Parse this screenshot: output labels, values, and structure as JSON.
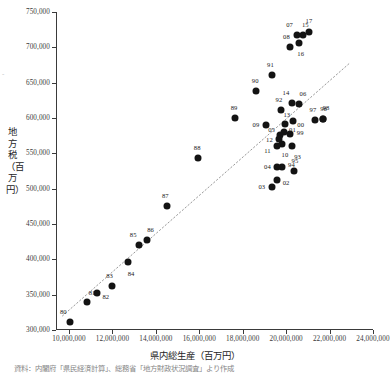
{
  "chart_data": {
    "type": "scatter",
    "title": "",
    "xlabel": "県内総生産（百万円）",
    "ylabel": "地方税（百万円）",
    "xlim": [
      9400000,
      24000000
    ],
    "ylim": [
      300000,
      750000
    ],
    "xticks": [
      10000000,
      12000000,
      14000000,
      16000000,
      18000000,
      20000000,
      22000000,
      24000000
    ],
    "xtick_labels": [
      "10,000,000",
      "12,000,000",
      "14,000,000",
      "16,000,000",
      "18,000,000",
      "20,000,000",
      "22,000,000",
      "24,000,000"
    ],
    "yticks": [
      300000,
      350000,
      400000,
      450000,
      500000,
      550000,
      600000,
      650000,
      700000,
      750000
    ],
    "ytick_labels": [
      "300,000",
      "350,000",
      "400,000",
      "450,000",
      "500,000",
      "550,000",
      "600,000",
      "650,000",
      "700,000",
      "750,000"
    ],
    "grid": false,
    "legend": "none",
    "marker_color": "#131313",
    "trendline": {
      "style": "dotted",
      "color": "#9a9a9a",
      "x1": 9700000,
      "y1": 320000,
      "x2": 22900000,
      "y2": 677000
    },
    "points": [
      {
        "label": "80",
        "x": 10060000,
        "y": 312000,
        "lx": -7,
        "ly": -11
      },
      {
        "label": "81",
        "x": 10830000,
        "y": 340000,
        "lx": 5,
        "ly": -10
      },
      {
        "label": "82",
        "x": 11280000,
        "y": 352000,
        "lx": 9,
        "ly": 3
      },
      {
        "label": "83",
        "x": 11960000,
        "y": 362000,
        "lx": -2,
        "ly": -11
      },
      {
        "label": "84",
        "x": 12720000,
        "y": 396000,
        "lx": 3,
        "ly": 11
      },
      {
        "label": "85",
        "x": 13230000,
        "y": 420000,
        "lx": -6,
        "ly": -11
      },
      {
        "label": "86",
        "x": 13570000,
        "y": 427000,
        "lx": 4,
        "ly": -11
      },
      {
        "label": "87",
        "x": 14530000,
        "y": 475000,
        "lx": -2,
        "ly": -11
      },
      {
        "label": "88",
        "x": 15950000,
        "y": 543000,
        "lx": -1,
        "ly": -11
      },
      {
        "label": "89",
        "x": 17650000,
        "y": 600000,
        "lx": -1,
        "ly": -11
      },
      {
        "label": "90",
        "x": 18620000,
        "y": 638000,
        "lx": -1,
        "ly": -11
      },
      {
        "label": "91",
        "x": 19370000,
        "y": 661000,
        "lx": -2,
        "ly": -11
      },
      {
        "label": "92",
        "x": 19760000,
        "y": 612000,
        "lx": -2,
        "ly": -11
      },
      {
        "label": "93",
        "x": 20250000,
        "y": 560000,
        "lx": 6,
        "ly": 10
      },
      {
        "label": "94",
        "x": 19830000,
        "y": 531000,
        "lx": 9,
        "ly": -3
      },
      {
        "label": "95",
        "x": 20360000,
        "y": 525000,
        "lx": 1,
        "ly": -11
      },
      {
        "label": "96",
        "x": 21680000,
        "y": 598000,
        "lx": 1,
        "ly": -11
      },
      {
        "label": "97",
        "x": 21330000,
        "y": 597000,
        "lx": -2,
        "ly": -11
      },
      {
        "label": "98",
        "x": 21700000,
        "y": 598000,
        "lx": 3,
        "ly": -12
      },
      {
        "label": "99",
        "x": 20190000,
        "y": 578000,
        "lx": 10,
        "ly": -2
      },
      {
        "label": "00",
        "x": 20300000,
        "y": 596000,
        "lx": 8,
        "ly": 3
      },
      {
        "label": "01",
        "x": 19920000,
        "y": 580000,
        "lx": 8,
        "ly": -3
      },
      {
        "label": "02",
        "x": 19580000,
        "y": 512000,
        "lx": 9,
        "ly": 2
      },
      {
        "label": "03",
        "x": 19340000,
        "y": 502000,
        "lx": -10,
        "ly": -1
      },
      {
        "label": "04",
        "x": 19600000,
        "y": 531000,
        "lx": -10,
        "ly": -1
      },
      {
        "label": "05",
        "x": 19700000,
        "y": 576000,
        "lx": -8,
        "ly": -6
      },
      {
        "label": "06",
        "x": 20590000,
        "y": 620000,
        "lx": 4,
        "ly": -11
      },
      {
        "label": "07",
        "x": 20480000,
        "y": 718000,
        "lx": -7,
        "ly": -11
      },
      {
        "label": "08",
        "x": 20200000,
        "y": 701000,
        "lx": -4,
        "ly": -11
      },
      {
        "label": "09",
        "x": 19070000,
        "y": 590000,
        "lx": -10,
        "ly": -1
      },
      {
        "label": "10",
        "x": 19810000,
        "y": 563000,
        "lx": 3,
        "ly": 10
      },
      {
        "label": "11",
        "x": 19600000,
        "y": 561000,
        "lx": -10,
        "ly": 4
      },
      {
        "label": "12",
        "x": 19690000,
        "y": 570000,
        "lx": -10,
        "ly": 0
      },
      {
        "label": "13",
        "x": 19940000,
        "y": 592000,
        "lx": 2,
        "ly": -10
      },
      {
        "label": "14",
        "x": 20270000,
        "y": 621000,
        "lx": -6,
        "ly": -11
      },
      {
        "label": "15",
        "x": 20790000,
        "y": 717000,
        "lx": 2,
        "ly": -11
      },
      {
        "label": "16",
        "x": 20580000,
        "y": 706000,
        "lx": 2,
        "ly": 10
      },
      {
        "label": "17",
        "x": 21050000,
        "y": 721000,
        "lx": 0,
        "ly": -12
      }
    ]
  },
  "caption": {
    "text": "資料：内閣府「県民経済計算」、総務省「地方財政状況調査」より作成",
    "y_mark": "-"
  }
}
